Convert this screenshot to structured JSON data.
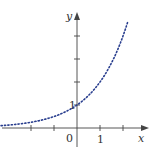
{
  "chart_data": {
    "type": "line",
    "title": "",
    "xlabel": "x",
    "ylabel": "y",
    "function": "y = 2^x",
    "xlim": [
      -3.3,
      2.9
    ],
    "ylim": [
      -0.8,
      5.4
    ],
    "x_ticks": [
      -2,
      -1,
      1,
      2
    ],
    "y_ticks": [
      1,
      2,
      3,
      4
    ],
    "tick_labels": {
      "origin": "0",
      "x_one": "1",
      "y_one": "1"
    },
    "series": [
      {
        "name": "y = 2^x",
        "style": "dotted",
        "color": "#2a3f8f",
        "x_range": [
          -3.3,
          2.2
        ],
        "points": [
          [
            -3.3,
            0.1
          ],
          [
            -3,
            0.125
          ],
          [
            -2,
            0.25
          ],
          [
            -1,
            0.5
          ],
          [
            0,
            1
          ],
          [
            0.5,
            1.41
          ],
          [
            1,
            2
          ],
          [
            1.5,
            2.83
          ],
          [
            2,
            4
          ],
          [
            2.2,
            4.6
          ]
        ]
      }
    ],
    "grid": false,
    "legend": "none"
  }
}
